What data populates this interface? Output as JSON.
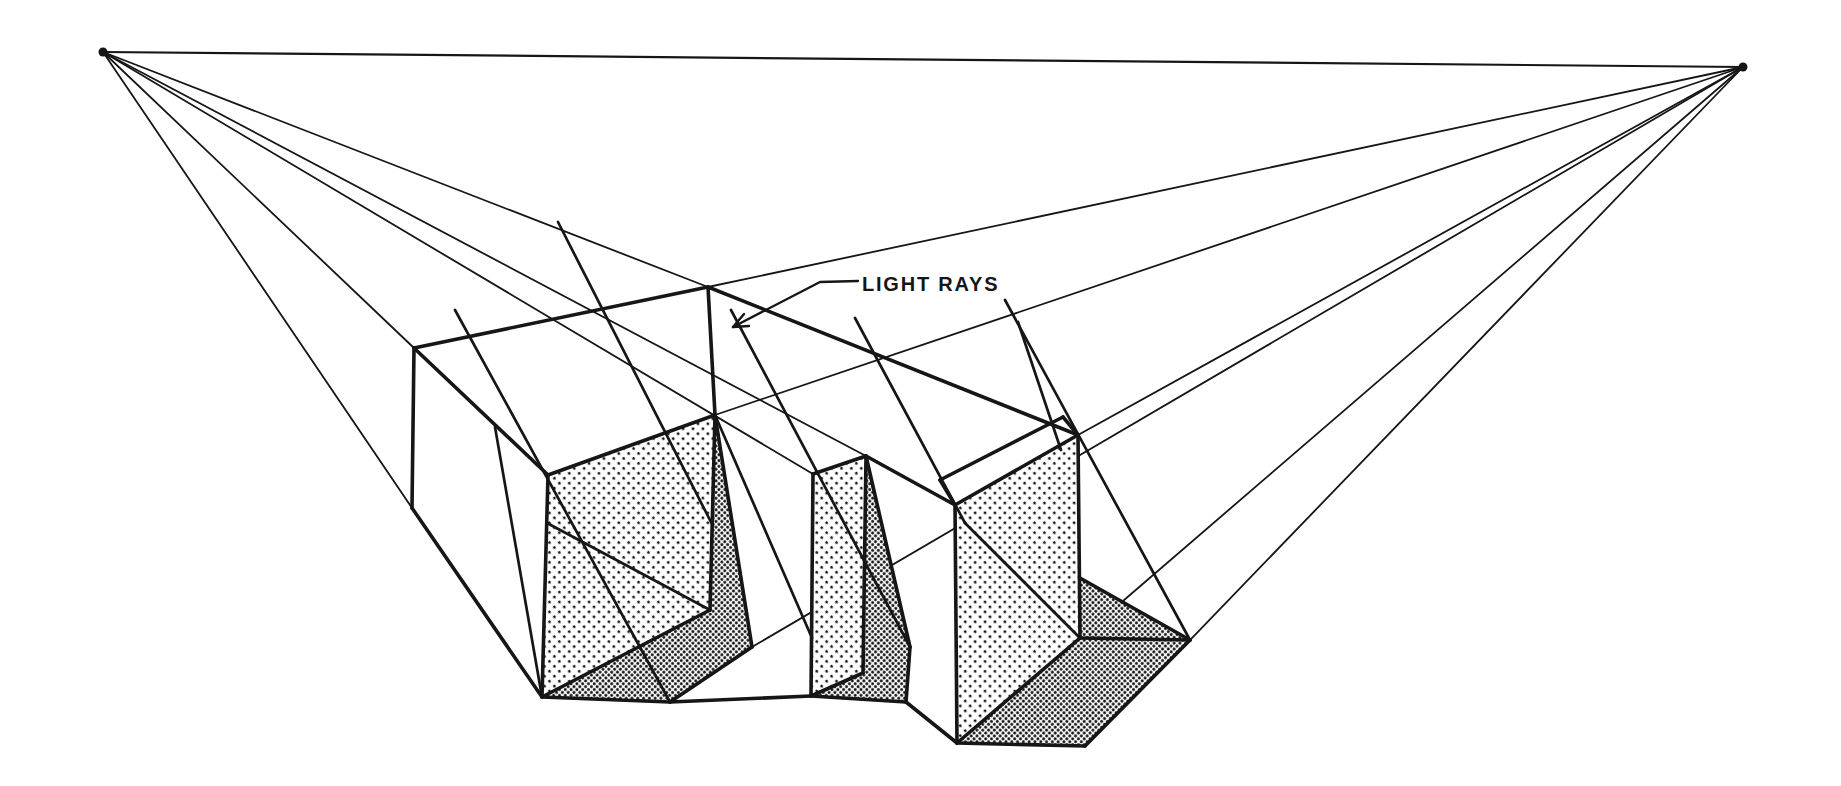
{
  "diagram": {
    "label": "LIGHT RAYS",
    "ink": "#161616",
    "paper": "#ffffff",
    "width": 1841,
    "height": 786,
    "vp_left": [
      103,
      52
    ],
    "vp_right": [
      1743,
      67
    ],
    "vp_dot_radius": 4.5,
    "horizon": [
      103,
      52,
      1743,
      67
    ],
    "construction_lines": [
      [
        103,
        52,
        414,
        348
      ],
      [
        103,
        52,
        412,
        508
      ],
      [
        103,
        52,
        708,
        287
      ],
      [
        103,
        52,
        813,
        474
      ],
      [
        103,
        52,
        866,
        456
      ],
      [
        1743,
        67,
        708,
        287
      ],
      [
        1743,
        67,
        715,
        415
      ],
      [
        1743,
        67,
        1078,
        435
      ],
      [
        1743,
        67,
        752,
        647
      ],
      [
        1743,
        67,
        1080,
        638
      ],
      [
        1743,
        67,
        1190,
        640
      ]
    ],
    "light_ray_lines": [
      [
        455,
        310,
        670,
        702
      ],
      [
        558,
        222,
        713,
        526
      ],
      [
        731,
        310,
        910,
        647
      ],
      [
        1005,
        300,
        1190,
        640
      ],
      [
        1018,
        322,
        1061,
        450
      ],
      [
        855,
        318,
        965,
        523
      ],
      [
        715,
        415,
        812,
        638
      ]
    ],
    "shadow_construction_segments": [
      [
        547,
        523,
        710,
        610
      ],
      [
        965,
        523,
        1080,
        638
      ],
      [
        495,
        427,
        542,
        697
      ]
    ],
    "heavy_edges": [
      [
        414,
        348,
        708,
        287
      ],
      [
        708,
        287,
        1078,
        435
      ],
      [
        414,
        348,
        548,
        475
      ],
      [
        414,
        348,
        412,
        508
      ],
      [
        412,
        508,
        542,
        697
      ],
      [
        548,
        475,
        542,
        697
      ],
      [
        548,
        475,
        715,
        415
      ],
      [
        708,
        287,
        715,
        415
      ],
      [
        715,
        415,
        710,
        610
      ],
      [
        710,
        610,
        542,
        697
      ],
      [
        715,
        415,
        752,
        647
      ],
      [
        752,
        647,
        670,
        702
      ],
      [
        670,
        702,
        542,
        697
      ],
      [
        670,
        702,
        811,
        696
      ],
      [
        813,
        474,
        866,
        456
      ],
      [
        813,
        474,
        811,
        696
      ],
      [
        866,
        456,
        863,
        673
      ],
      [
        811,
        696,
        863,
        673
      ],
      [
        866,
        456,
        910,
        647
      ],
      [
        910,
        647,
        906,
        702
      ],
      [
        906,
        702,
        811,
        696
      ],
      [
        866,
        456,
        955,
        505
      ],
      [
        906,
        702,
        957,
        743
      ],
      [
        940,
        480,
        1063,
        417
      ],
      [
        1063,
        417,
        1078,
        435
      ],
      [
        940,
        480,
        955,
        505
      ],
      [
        955,
        505,
        1078,
        435
      ],
      [
        1078,
        435,
        1080,
        638
      ],
      [
        1080,
        638,
        957,
        743
      ],
      [
        955,
        505,
        957,
        743
      ],
      [
        957,
        743,
        1085,
        746
      ],
      [
        1085,
        746,
        1190,
        640
      ],
      [
        1190,
        640,
        1080,
        578
      ],
      [
        1080,
        638,
        1190,
        640
      ]
    ],
    "shaded_faces": [
      [
        [
          548,
          475
        ],
        [
          715,
          415
        ],
        [
          710,
          610
        ],
        [
          542,
          697
        ]
      ],
      [
        [
          813,
          474
        ],
        [
          866,
          456
        ],
        [
          863,
          673
        ],
        [
          811,
          696
        ]
      ],
      [
        [
          955,
          505
        ],
        [
          1078,
          435
        ],
        [
          1080,
          638
        ],
        [
          957,
          743
        ]
      ]
    ],
    "shadow_polygons": [
      [
        [
          715,
          415
        ],
        [
          710,
          610
        ],
        [
          542,
          697
        ],
        [
          670,
          702
        ],
        [
          752,
          647
        ]
      ],
      [
        [
          866,
          456
        ],
        [
          910,
          647
        ],
        [
          906,
          702
        ],
        [
          811,
          696
        ],
        [
          863,
          673
        ]
      ],
      [
        [
          1080,
          578
        ],
        [
          1190,
          640
        ],
        [
          1085,
          746
        ],
        [
          957,
          743
        ],
        [
          1080,
          638
        ]
      ]
    ],
    "leader_points": [
      [
        858,
        281
      ],
      [
        820,
        282
      ],
      [
        733,
        327
      ]
    ],
    "arrowhead_lines": [
      [
        733,
        327,
        749,
        326
      ],
      [
        733,
        327,
        744,
        314
      ]
    ],
    "label_anchor": [
      862,
      291
    ],
    "label_font_size": 20,
    "stroke": {
      "heavy": 3.6,
      "ray": 2.7,
      "thin": 1.8,
      "horizon": 2.2,
      "leader": 2.4
    }
  }
}
